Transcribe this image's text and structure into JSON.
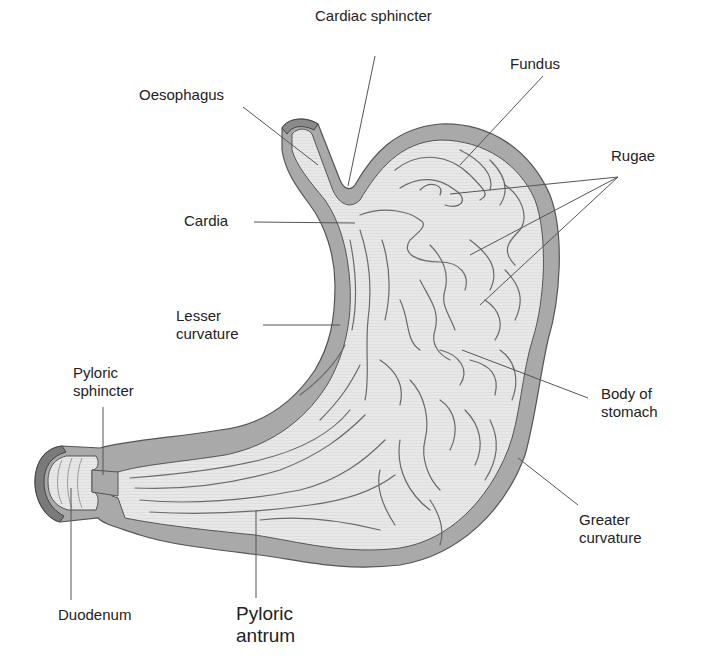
{
  "diagram": {
    "colors": {
      "wall": "#a9a9a9",
      "wall_outline": "#555555",
      "lumen": "#e6e6e6",
      "rugae": "#6a6a6a",
      "leader": "#555555",
      "text": "#222222",
      "background": "#ffffff"
    },
    "labels": {
      "cardiac_sphincter": "Cardiac sphincter",
      "fundus": "Fundus",
      "oesophagus": "Oesophagus",
      "rugae": "Rugae",
      "cardia": "Cardia",
      "lesser_curvature_1": "Lesser",
      "lesser_curvature_2": "curvature",
      "pyloric_sphincter_1": "Pyloric",
      "pyloric_sphincter_2": "sphincter",
      "body_of_stomach_1": "Body of",
      "body_of_stomach_2": "stomach",
      "greater_curvature_1": "Greater",
      "greater_curvature_2": "curvature",
      "duodenum": "Duodenum",
      "pyloric_antrum_1": "Pyloric",
      "pyloric_antrum_2": "antrum"
    }
  }
}
